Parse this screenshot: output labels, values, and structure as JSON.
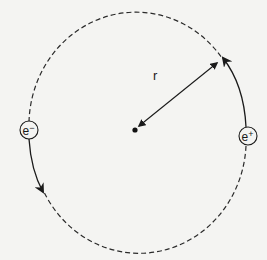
{
  "diagram": {
    "type": "circular orbit",
    "center": {
      "x": 135,
      "y": 130
    },
    "radius_px": 113,
    "radius_label": "r",
    "particles": [
      {
        "id": "electron",
        "label": "e−",
        "base": "e",
        "sup": "−",
        "position": "left"
      },
      {
        "id": "positron",
        "label": "e+",
        "base": "e",
        "sup": "+",
        "position": "right"
      }
    ],
    "arcs": {
      "solid_segments": [
        "electron moving downward (counter-clockwise) with arrow",
        "positron moving upward with arrow"
      ],
      "dashed_segments": [
        "remainder of circular orbit"
      ]
    },
    "colors": {
      "ink": "#1a1a1a",
      "paper": "#f4f4f2"
    }
  }
}
